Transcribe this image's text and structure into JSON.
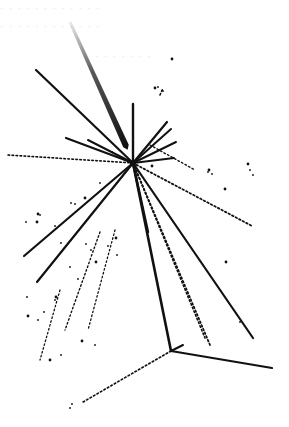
{
  "image": {
    "width": 289,
    "height": 427,
    "background": "#ffffff",
    "ink": "#111111"
  },
  "ghost_text": [
    {
      "text": "· · ·  · ·  · · ·  · · · ·",
      "x": 0,
      "y": 2
    },
    {
      "text": "· · ·  · · · · · ·    · · ·",
      "x": 0,
      "y": 20
    },
    {
      "text": "· · · · · · ·",
      "x": 95,
      "y": 50
    }
  ],
  "incoming_track": {
    "x1": 70,
    "y1": 22,
    "x2": 126,
    "y2": 146,
    "width": 6
  },
  "primary_vertex": {
    "x": 133,
    "y": 163
  },
  "solid_tracks": [
    {
      "x1": 36,
      "y1": 70,
      "x2": 133,
      "y2": 163,
      "w": 2.2
    },
    {
      "x1": 66,
      "y1": 138,
      "x2": 133,
      "y2": 163,
      "w": 2.2
    },
    {
      "x1": 88,
      "y1": 140,
      "x2": 133,
      "y2": 163,
      "w": 2
    },
    {
      "x1": 133,
      "y1": 104,
      "x2": 133,
      "y2": 163,
      "w": 2.4
    },
    {
      "x1": 167,
      "y1": 122,
      "x2": 133,
      "y2": 163,
      "w": 2.2
    },
    {
      "x1": 171,
      "y1": 129,
      "x2": 133,
      "y2": 163,
      "w": 2
    },
    {
      "x1": 176,
      "y1": 142,
      "x2": 133,
      "y2": 163,
      "w": 2
    },
    {
      "x1": 174,
      "y1": 158,
      "x2": 133,
      "y2": 163,
      "w": 1.8
    },
    {
      "x1": 24,
      "y1": 256,
      "x2": 133,
      "y2": 163,
      "w": 2.2
    },
    {
      "x1": 37,
      "y1": 282,
      "x2": 133,
      "y2": 163,
      "w": 2.2
    },
    {
      "x1": 133,
      "y1": 163,
      "x2": 171,
      "y2": 351,
      "w": 2.6
    },
    {
      "x1": 133,
      "y1": 163,
      "x2": 253,
      "y2": 338,
      "w": 2.2
    },
    {
      "x1": 133,
      "y1": 163,
      "x2": 148,
      "y2": 232,
      "w": 2.4
    },
    {
      "x1": 171,
      "y1": 351,
      "x2": 272,
      "y2": 368,
      "w": 2.2
    },
    {
      "x1": 171,
      "y1": 351,
      "x2": 183,
      "y2": 345,
      "w": 2
    }
  ],
  "dotted_tracks": [
    {
      "x1": 8,
      "y1": 155,
      "x2": 133,
      "y2": 163,
      "w": 1.6
    },
    {
      "x1": 133,
      "y1": 163,
      "x2": 252,
      "y2": 226,
      "w": 1.8
    },
    {
      "x1": 133,
      "y1": 163,
      "x2": 210,
      "y2": 345,
      "w": 1.8
    },
    {
      "x1": 133,
      "y1": 163,
      "x2": 205,
      "y2": 338,
      "w": 1.6
    },
    {
      "x1": 171,
      "y1": 351,
      "x2": 83,
      "y2": 402,
      "w": 1.7
    },
    {
      "x1": 100,
      "y1": 232,
      "x2": 65,
      "y2": 330,
      "w": 1.4
    },
    {
      "x1": 115,
      "y1": 230,
      "x2": 88,
      "y2": 330,
      "w": 1.3
    },
    {
      "x1": 60,
      "y1": 290,
      "x2": 40,
      "y2": 360,
      "w": 1.3
    },
    {
      "x1": 150,
      "y1": 145,
      "x2": 195,
      "y2": 170,
      "w": 1.4
    },
    {
      "x1": 160,
      "y1": 95,
      "x2": 163,
      "y2": 88,
      "w": 1.6
    }
  ],
  "specks": [
    [
      172,
      59
    ],
    [
      163,
      91
    ],
    [
      158,
      87
    ],
    [
      155,
      88
    ],
    [
      71,
      203
    ],
    [
      75,
      204
    ],
    [
      85,
      198
    ],
    [
      40,
      215
    ],
    [
      55,
      226
    ],
    [
      37,
      222
    ],
    [
      26,
      222
    ],
    [
      61,
      243
    ],
    [
      38,
      214
    ],
    [
      117,
      255
    ],
    [
      108,
      246
    ],
    [
      116,
      238
    ],
    [
      86,
      244
    ],
    [
      91,
      250
    ],
    [
      96,
      262
    ],
    [
      70,
      267
    ],
    [
      78,
      279
    ],
    [
      56,
      297
    ],
    [
      44,
      312
    ],
    [
      38,
      320
    ],
    [
      28,
      316
    ],
    [
      27,
      297
    ],
    [
      55,
      300
    ],
    [
      82,
      341
    ],
    [
      95,
      345
    ],
    [
      61,
      355
    ],
    [
      50,
      360
    ],
    [
      72,
      404
    ],
    [
      70,
      408
    ],
    [
      209,
      170
    ],
    [
      208,
      172
    ],
    [
      212,
      174
    ],
    [
      248,
      164
    ],
    [
      250,
      170
    ],
    [
      253,
      175
    ],
    [
      226,
      262
    ],
    [
      240,
      322
    ],
    [
      160,
      296
    ],
    [
      225,
      189
    ],
    [
      112,
      152
    ],
    [
      100,
      183
    ],
    [
      152,
      166
    ]
  ]
}
